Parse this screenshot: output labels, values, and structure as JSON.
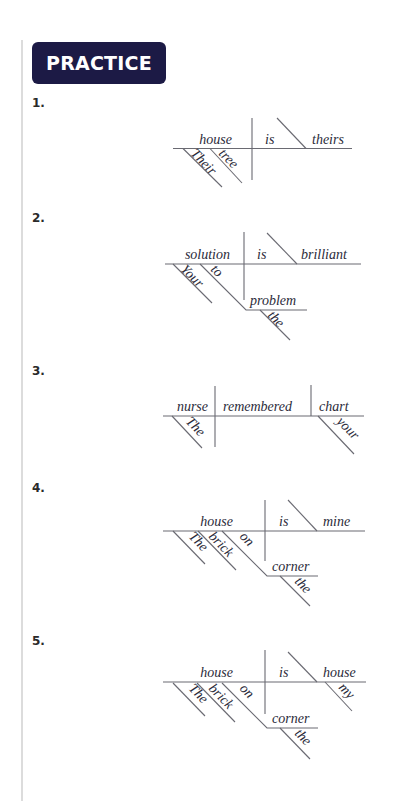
{
  "header": {
    "title": "PRACTICE 5-4",
    "badge_color": "#1c1a45"
  },
  "exercises": [
    {
      "number": "1.",
      "subject": "house",
      "verb": "is",
      "complement": "theirs",
      "modifiers": [
        "Their",
        "tree"
      ]
    },
    {
      "number": "2.",
      "subject": "solution",
      "verb": "is",
      "complement": "brilliant",
      "modifiers": [
        "Your",
        "to",
        "problem",
        "the"
      ]
    },
    {
      "number": "3.",
      "subject": "nurse",
      "verb": "remembered",
      "object": "chart",
      "modifiers": [
        "The",
        "your"
      ]
    },
    {
      "number": "4.",
      "subject": "house",
      "verb": "is",
      "complement": "mine",
      "modifiers": [
        "The",
        "brick",
        "on",
        "corner",
        "the"
      ]
    },
    {
      "number": "5.",
      "subject": "house",
      "verb": "is",
      "complement": "house",
      "modifiers": [
        "The",
        "brick",
        "on",
        "corner",
        "the",
        "my"
      ]
    }
  ]
}
